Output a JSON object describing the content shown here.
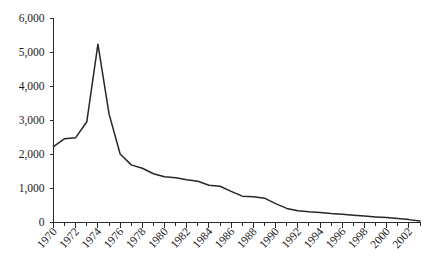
{
  "chart_data": {
    "type": "line",
    "title": "",
    "subtitle": "",
    "xlabel": "",
    "ylabel": "",
    "grid": false,
    "legend": false,
    "legend_position": "none",
    "line_color": "#262626",
    "axis_color": "#2a2a2a",
    "background_color": "#ffffff",
    "xlim": [
      1970,
      2003
    ],
    "ylim": [
      0,
      6000
    ],
    "ytick_values": [
      0,
      1000,
      2000,
      3000,
      4000,
      5000,
      6000
    ],
    "ytick_labels": [
      "0",
      "1,000",
      "2,000",
      "3,000",
      "4,000",
      "5,000",
      "6,000"
    ],
    "xtick_values": [
      1970,
      1972,
      1974,
      1976,
      1978,
      1980,
      1982,
      1984,
      1986,
      1988,
      1990,
      1992,
      1994,
      1996,
      1998,
      2000,
      2002
    ],
    "xtick_labels": [
      "1970",
      "1972",
      "1974",
      "1976",
      "1978",
      "1980",
      "1982",
      "1984",
      "1986",
      "1988",
      "1990",
      "1992",
      "1994",
      "1996",
      "1998",
      "2000",
      "2002"
    ],
    "xtick_label_rotation": -48,
    "x": [
      1970,
      1971,
      1972,
      1973,
      1974,
      1975,
      1976,
      1977,
      1978,
      1979,
      1980,
      1981,
      1982,
      1983,
      1984,
      1985,
      1986,
      1987,
      1988,
      1989,
      1990,
      1991,
      1992,
      1993,
      1994,
      1995,
      1996,
      1997,
      1998,
      1999,
      2000,
      2001,
      2002,
      2003
    ],
    "values": [
      2220,
      2450,
      2480,
      2950,
      5230,
      3180,
      2000,
      1680,
      1580,
      1420,
      1330,
      1300,
      1240,
      1200,
      1080,
      1050,
      900,
      760,
      740,
      700,
      540,
      400,
      330,
      300,
      280,
      250,
      230,
      200,
      175,
      150,
      130,
      100,
      70,
      30
    ],
    "series": [
      {
        "name": "series-1",
        "values": [
          2220,
          2450,
          2480,
          2950,
          5230,
          3180,
          2000,
          1680,
          1580,
          1420,
          1330,
          1300,
          1240,
          1200,
          1080,
          1050,
          900,
          760,
          740,
          700,
          540,
          400,
          330,
          300,
          280,
          250,
          230,
          200,
          175,
          150,
          130,
          100,
          70,
          30
        ]
      }
    ],
    "peak": {
      "x": 1974,
      "y": 5230
    },
    "minor_xticks_interval": 1
  }
}
